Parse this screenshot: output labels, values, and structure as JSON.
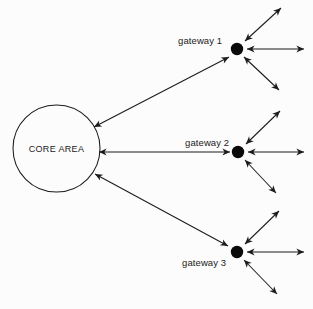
{
  "diagram": {
    "background_color": "#fcfcfc",
    "stroke_color": "#1b1b1b",
    "node_fill_color": "#0a0a0a",
    "core": {
      "label": "CORE AREA",
      "shape": "circle",
      "cx": 56.5,
      "cy": 148.5,
      "r": 43.5,
      "fill": "#fcfcfc",
      "stroke": "#1b1b1b"
    },
    "gateways": [
      {
        "id": "gateway-1",
        "label": "gateway 1",
        "label_x": 178,
        "label_y": 44,
        "cx": 237,
        "cy": 49,
        "r": 6.2,
        "core_link": {
          "x1": 94,
          "y1": 127,
          "x2": 229,
          "y2": 57
        },
        "spokes": [
          {
            "name": "spoke-up-right",
            "x1": 245,
            "y1": 41,
            "x2": 281,
            "y2": 8
          },
          {
            "name": "spoke-right",
            "x1": 247,
            "y1": 49,
            "x2": 304,
            "y2": 49
          },
          {
            "name": "spoke-down-right",
            "x1": 244,
            "y1": 57,
            "x2": 279,
            "y2": 90
          }
        ]
      },
      {
        "id": "gateway-2",
        "label": "gateway 2",
        "label_x": 185,
        "label_y": 146,
        "cx": 238,
        "cy": 152,
        "r": 6.2,
        "core_link": {
          "x1": 99,
          "y1": 152,
          "x2": 230,
          "y2": 152
        },
        "spokes": [
          {
            "name": "spoke-up-right",
            "x1": 246,
            "y1": 144,
            "x2": 280,
            "y2": 111
          },
          {
            "name": "spoke-right",
            "x1": 248,
            "y1": 152,
            "x2": 304,
            "y2": 152
          },
          {
            "name": "spoke-down-right",
            "x1": 245,
            "y1": 160,
            "x2": 276,
            "y2": 193
          }
        ]
      },
      {
        "id": "gateway-3",
        "label": "gateway 3",
        "label_x": 182,
        "label_y": 266,
        "cx": 237,
        "cy": 252,
        "r": 6.2,
        "core_link": {
          "x1": 95,
          "y1": 174,
          "x2": 228,
          "y2": 246
        },
        "spokes": [
          {
            "name": "spoke-up-right",
            "x1": 245,
            "y1": 244,
            "x2": 279,
            "y2": 211
          },
          {
            "name": "spoke-right",
            "x1": 247,
            "y1": 252,
            "x2": 304,
            "y2": 252
          },
          {
            "name": "spoke-down-right",
            "x1": 244,
            "y1": 260,
            "x2": 277,
            "y2": 294
          }
        ]
      }
    ]
  }
}
